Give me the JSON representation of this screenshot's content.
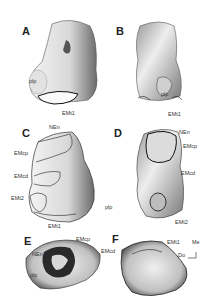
{
  "figure": {
    "panels": [
      {
        "id": "A",
        "label": "A",
        "annotations": [
          "plp",
          "EMt1"
        ]
      },
      {
        "id": "B",
        "label": "B",
        "annotations": [
          "plp",
          "EMt1"
        ]
      },
      {
        "id": "C",
        "label": "C",
        "annotations": [
          "NEn",
          "EMcp",
          "EMcd",
          "EMt2",
          "EMt1",
          "plp"
        ]
      },
      {
        "id": "D",
        "label": "D",
        "annotations": [
          "NEn",
          "EMcp",
          "EMcd",
          "EMt2"
        ]
      },
      {
        "id": "E",
        "label": "E",
        "annotations": [
          "NEn",
          "EMcp",
          "EMcd",
          "plp"
        ]
      },
      {
        "id": "F",
        "label": "F",
        "annotations": [
          "EMt1",
          "Me",
          "Do"
        ]
      }
    ],
    "orientation_key": {
      "medial": "Me",
      "dorsal": "Do"
    }
  }
}
